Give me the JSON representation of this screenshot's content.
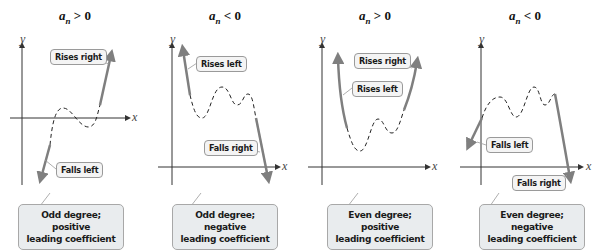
{
  "panels": [
    {
      "title": {
        "var": "a",
        "sub": "n",
        "rel": "> 0"
      },
      "axis_x": "x",
      "axis_y": "y",
      "tags": [
        "Rises right",
        "Falls left"
      ],
      "summary": [
        "Odd degree; positive",
        "leading coefficient"
      ]
    },
    {
      "title": {
        "var": "a",
        "sub": "n",
        "rel": "< 0"
      },
      "axis_x": "x",
      "axis_y": "y",
      "tags": [
        "Rises left",
        "Falls right"
      ],
      "summary": [
        "Odd degree; negative",
        "leading coefficient"
      ]
    },
    {
      "title": {
        "var": "a",
        "sub": "n",
        "rel": "> 0"
      },
      "axis_x": "x",
      "axis_y": "y",
      "tags": [
        "Rises right",
        "Rises left"
      ],
      "summary": [
        "Even degree; positive",
        "leading coefficient"
      ]
    },
    {
      "title": {
        "var": "a",
        "sub": "n",
        "rel": "< 0"
      },
      "axis_x": "x",
      "axis_y": "y",
      "tags": [
        "Falls left",
        "Falls right"
      ],
      "summary": [
        "Even degree; negative",
        "leading coefficient"
      ]
    }
  ],
  "colors": {
    "end_behavior": "#7f7f7f",
    "axis": "#333333",
    "dashed_curve": "#222222",
    "summary_bg": "#e9ecee",
    "tag_bg": "#f4f4f4"
  }
}
